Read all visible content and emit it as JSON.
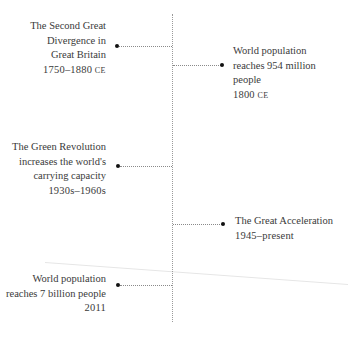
{
  "timeline": {
    "events": [
      {
        "side": "left",
        "title_lines": [
          "The Second Great",
          "Divergence in",
          "Great Britain"
        ],
        "date": "1750–1880",
        "era": "CE"
      },
      {
        "side": "right",
        "title_lines": [
          "World population",
          "reaches 954 million",
          "people"
        ],
        "date": "1800",
        "era": "CE"
      },
      {
        "side": "left",
        "title_lines": [
          "The Green Revolution",
          "increases the world's",
          "carrying capacity"
        ],
        "date": "1930s–1960s",
        "era": ""
      },
      {
        "side": "right",
        "title_lines": [
          "The Great Acceleration"
        ],
        "date": "1945–present",
        "era": ""
      },
      {
        "side": "left",
        "title_lines": [
          "World population",
          "reaches 7 billion people"
        ],
        "date": "2011",
        "era": ""
      }
    ]
  },
  "colors": {
    "text": "#3a3a3a",
    "dot": "#111111",
    "axis": "#9a9a9a"
  }
}
